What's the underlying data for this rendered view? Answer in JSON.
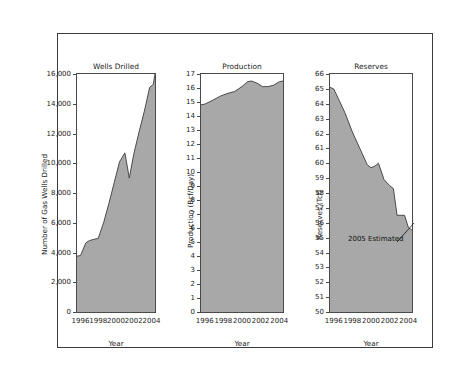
{
  "figure": {
    "title_line1": "Canada's Exploration Treadmill—More and More Drilling",
    "title_line2": "to Find Less and Less Gas",
    "area_fill": "#a8a8a8",
    "line_color": "#4a4a4a",
    "border_color": "#3b3b3b",
    "background": "#ffffff"
  },
  "chart_data": [
    {
      "type": "area",
      "title": "Wells Drilled",
      "xlabel": "Year",
      "ylabel": "Number of Gas Wells Drilled",
      "xlim": [
        1995.6,
        2004.4
      ],
      "ylim": [
        0,
        16000
      ],
      "grid": false,
      "legend": null,
      "xticks": [
        1996,
        1998,
        2000,
        2002,
        2004
      ],
      "xtick_labels": [
        "1996",
        "1998",
        "2000",
        "2002",
        "2004"
      ],
      "yticks": [
        0,
        2000,
        4000,
        6000,
        8000,
        10000,
        12000,
        14000,
        16000
      ],
      "ytick_labels": [
        "0",
        "2,000",
        "4,000",
        "6,000",
        "8,000",
        "10,000",
        "12,000",
        "14,000",
        "16,000"
      ],
      "x": [
        1995.6,
        1996.0,
        1996.6,
        1997.0,
        1997.6,
        1998.0,
        1998.6,
        1999.2,
        1999.8,
        2000.4,
        2001.0,
        2001.5,
        2002.0,
        2002.6,
        2003.2,
        2003.8,
        2004.2,
        2004.4
      ],
      "values": [
        3750,
        3800,
        4650,
        4800,
        4900,
        4950,
        6000,
        7300,
        8700,
        10100,
        10700,
        9000,
        10600,
        12100,
        13500,
        15100,
        15300,
        16000
      ]
    },
    {
      "type": "area",
      "title": "Production",
      "xlabel": "Year",
      "ylabel": "Production (Bcf/Day)",
      "xlim": [
        1995.6,
        2004.4
      ],
      "ylim": [
        0,
        17
      ],
      "grid": false,
      "legend": null,
      "xticks": [
        1996,
        1998,
        2000,
        2002,
        2004
      ],
      "xtick_labels": [
        "1996",
        "1998",
        "2000",
        "2002",
        "2004"
      ],
      "yticks": [
        0,
        1,
        2,
        3,
        4,
        5,
        6,
        7,
        8,
        9,
        10,
        11,
        12,
        13,
        14,
        15,
        16,
        17
      ],
      "ytick_labels": [
        "0",
        "1",
        "2",
        "3",
        "4",
        "5",
        "6",
        "7",
        "8",
        "9",
        "10",
        "11",
        "12",
        "13",
        "14",
        "15",
        "16",
        "17"
      ],
      "x": [
        1995.6,
        1996.0,
        1996.8,
        1997.6,
        1998.4,
        1999.2,
        2000.0,
        2000.6,
        2001.0,
        2001.6,
        2002.2,
        2002.8,
        2003.4,
        2004.0,
        2004.4
      ],
      "values": [
        14.8,
        14.85,
        15.1,
        15.4,
        15.6,
        15.75,
        16.1,
        16.45,
        16.5,
        16.35,
        16.1,
        16.1,
        16.2,
        16.45,
        16.5
      ]
    },
    {
      "type": "area",
      "title": "Reserves",
      "xlabel": "Year",
      "ylabel": "Reserves (Tcf)",
      "xlim": [
        1995.6,
        2004.4
      ],
      "ylim": [
        50,
        66
      ],
      "grid": false,
      "legend": null,
      "annotation": "2005 Estimated",
      "xticks": [
        1996,
        1998,
        2000,
        2002,
        2004
      ],
      "xtick_labels": [
        "1996",
        "1998",
        "2000",
        "2002",
        "2004"
      ],
      "yticks": [
        50,
        51,
        52,
        53,
        54,
        55,
        56,
        57,
        58,
        59,
        60,
        61,
        62,
        63,
        64,
        65,
        66
      ],
      "ytick_labels": [
        "50",
        "51",
        "52",
        "53",
        "54",
        "55",
        "56",
        "57",
        "58",
        "59",
        "60",
        "61",
        "62",
        "63",
        "64",
        "65",
        "66"
      ],
      "x": [
        1995.6,
        1996.0,
        1996.6,
        1997.2,
        1998.0,
        1998.8,
        1999.6,
        2000.0,
        2000.4,
        2000.8,
        2001.4,
        2002.0,
        2002.4,
        2002.8,
        2003.6,
        2004.0,
        2004.4
      ],
      "values": [
        65.1,
        65.0,
        64.2,
        63.4,
        62.1,
        61.0,
        59.9,
        59.7,
        59.8,
        60.0,
        58.9,
        58.5,
        58.3,
        56.5,
        56.5,
        55.7,
        55.5
      ]
    }
  ]
}
